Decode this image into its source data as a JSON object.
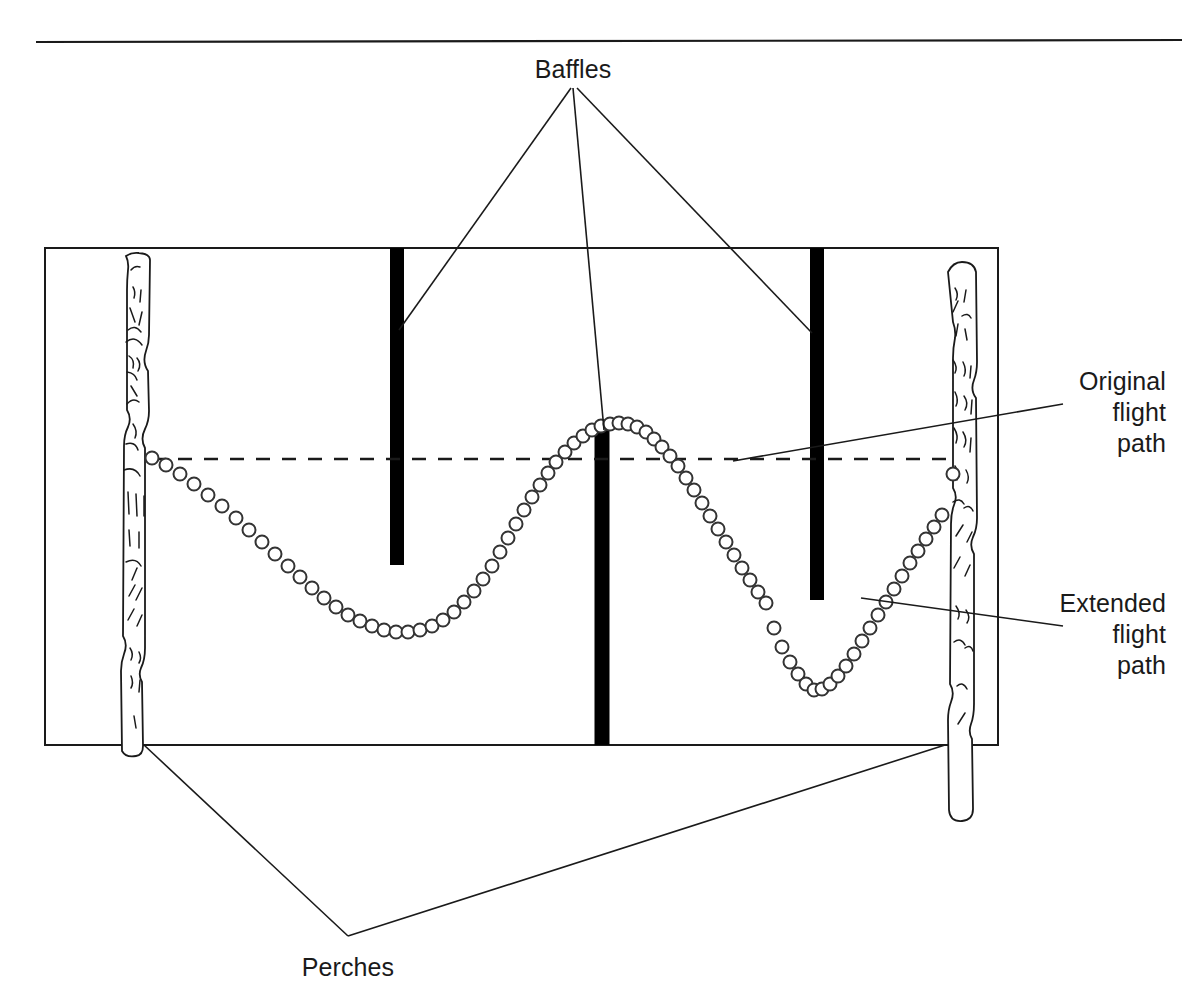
{
  "figure": {
    "title_rule": "horizontal-rule",
    "background_color": "#ffffff",
    "line_color": "#1a1a1a",
    "baffle_color": "#000000",
    "labels": {
      "baffles": "Baffles",
      "perches": "Perches",
      "original_flight_path_line1": "Original",
      "original_flight_path_line2": "flight",
      "original_flight_path_line3": "path",
      "extended_flight_path_line1": "Extended",
      "extended_flight_path_line2": "flight",
      "extended_flight_path_line3": "path"
    }
  },
  "chart_data": {
    "type": "line",
    "title": "Baffles",
    "xlabel": "",
    "ylabel": "",
    "xlim": [
      45,
      998
    ],
    "ylim": [
      248,
      745
    ],
    "grid": false,
    "legend_position": "right",
    "annotations": [
      {
        "name": "Baffles",
        "text": "Baffles",
        "x": 573,
        "y": 70
      },
      {
        "name": "Perches",
        "text": "Perches",
        "x": 348,
        "y": 968
      },
      {
        "name": "Original flight path",
        "text": "Original flight path",
        "x": 1110,
        "y": 382
      },
      {
        "name": "Extended flight path",
        "text": "Extended flight path",
        "x": 1110,
        "y": 604
      }
    ],
    "cage": {
      "x": 45,
      "y": 248,
      "width": 953,
      "height": 497
    },
    "perches": [
      {
        "name": "left-perch",
        "x": 138,
        "top": 254,
        "bottom": 745,
        "width": 26
      },
      {
        "name": "right-perch",
        "x": 958,
        "top": 262,
        "bottom": 748,
        "width": 26
      }
    ],
    "baffles": [
      {
        "name": "baffle-left",
        "x": 397,
        "top": 248,
        "bottom": 565,
        "width": 14,
        "mounted": "ceiling"
      },
      {
        "name": "baffle-middle",
        "x": 602,
        "top": 428,
        "bottom": 745,
        "width": 15,
        "mounted": "floor"
      },
      {
        "name": "baffle-right",
        "x": 817,
        "top": 248,
        "bottom": 600,
        "width": 14,
        "mounted": "ceiling"
      }
    ],
    "series": [
      {
        "name": "Original flight path",
        "style": "dashed",
        "x": [
          152,
          953
        ],
        "y": [
          459,
          459
        ]
      },
      {
        "name": "Extended flight path",
        "style": "circles",
        "marker": "open-circle",
        "marker_diameter": 13,
        "points_x": [
          152,
          166,
          180,
          194,
          208,
          222,
          236,
          249,
          262,
          275,
          288,
          300,
          312,
          324,
          336,
          348,
          360,
          372,
          384,
          396,
          408,
          420,
          432,
          443,
          454,
          464,
          474,
          483,
          492,
          500,
          508,
          516,
          524,
          532,
          540,
          548,
          556,
          565,
          574,
          583,
          592,
          601,
          610,
          619,
          628,
          637,
          646,
          654,
          662,
          670,
          678,
          686,
          694,
          702,
          710,
          718,
          726,
          734,
          742,
          750,
          758,
          766,
          774,
          782,
          790,
          798,
          806,
          814,
          822,
          830,
          838,
          846,
          854,
          862,
          870,
          878,
          886,
          894,
          902,
          910,
          918,
          926,
          934,
          942,
          953
        ],
        "points_y": [
          458,
          465,
          474,
          484,
          495,
          506,
          518,
          530,
          542,
          554,
          566,
          577,
          588,
          598,
          607,
          615,
          621,
          626,
          630,
          632,
          632,
          630,
          626,
          620,
          612,
          602,
          591,
          579,
          566,
          552,
          538,
          524,
          510,
          497,
          485,
          473,
          462,
          452,
          443,
          436,
          430,
          426,
          424,
          423,
          424,
          427,
          432,
          439,
          447,
          456,
          466,
          478,
          490,
          503,
          516,
          529,
          542,
          555,
          568,
          580,
          592,
          603,
          628,
          647,
          662,
          674,
          684,
          690,
          689,
          684,
          676,
          666,
          654,
          641,
          628,
          615,
          602,
          589,
          576,
          563,
          551,
          539,
          527,
          515,
          474
        ]
      }
    ]
  }
}
